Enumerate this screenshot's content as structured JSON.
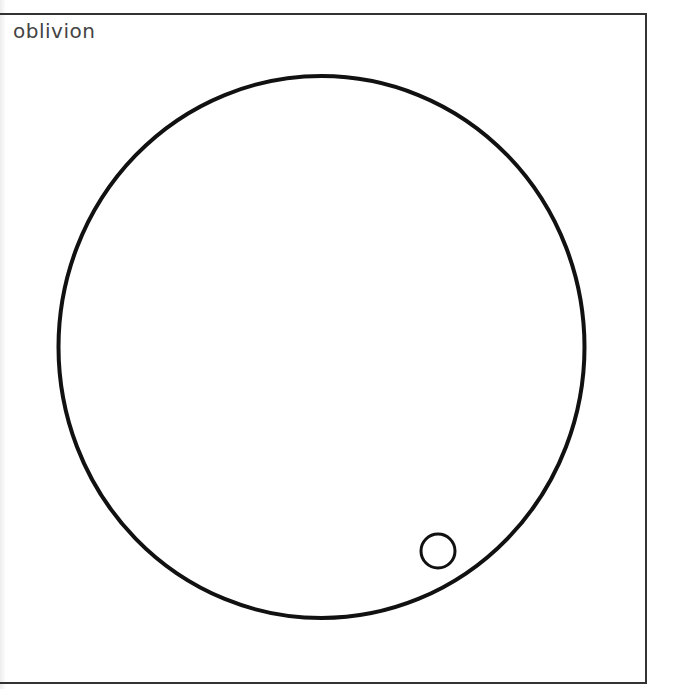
{
  "panel": {
    "title": "oblivion"
  },
  "diagram": {
    "shapes": [
      {
        "name": "large-circle",
        "type": "ellipse",
        "cx": 321.5,
        "cy": 347,
        "rx": 263,
        "ry": 271,
        "stroke": "#111111",
        "stroke_width": 4
      },
      {
        "name": "small-circle",
        "type": "circle",
        "cx": 438,
        "cy": 551,
        "r": 17,
        "stroke": "#111111",
        "stroke_width": 3
      }
    ]
  },
  "colors": {
    "background": "#ffffff",
    "frame": "#333333",
    "title_text": "#444444",
    "stroke": "#111111"
  }
}
